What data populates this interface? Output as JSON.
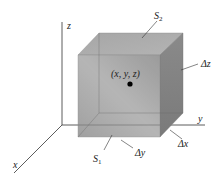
{
  "diagram": {
    "type": "3d-box-volume-element",
    "axes": {
      "z": {
        "label": "z"
      },
      "y": {
        "label": "y"
      },
      "x": {
        "label": "x"
      }
    },
    "point": {
      "label": "(x, y, z)"
    },
    "surfaces": {
      "top": {
        "label": "S",
        "subscript": "2"
      },
      "bottom": {
        "label": "S",
        "subscript": "1"
      }
    },
    "dimensions": {
      "dx": {
        "label": "Δx"
      },
      "dy": {
        "label": "Δy"
      },
      "dz": {
        "label": "Δz"
      }
    },
    "colors": {
      "front_face": "#9a9a9a",
      "top_face": "#a8a8a8",
      "side_face": "#7e7e7e",
      "axis": "#333333",
      "point": "#000000"
    }
  }
}
